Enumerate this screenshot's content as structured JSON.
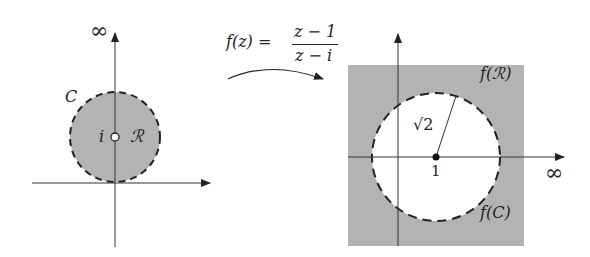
{
  "left_plot": {
    "infinity_label": "∞",
    "curve_label": "C",
    "point_label": "i",
    "region_label": "ℛ"
  },
  "mapping": {
    "lhs": "f(z) =",
    "numerator": "z − 1",
    "denominator": "z − i"
  },
  "right_plot": {
    "region_label": "f(ℛ)",
    "radius_label": "√2",
    "center_label": "1",
    "curve_label": "f(C)",
    "infinity_label": "∞"
  },
  "colors": {
    "shade": "#b3b3b3",
    "line": "#222222"
  }
}
